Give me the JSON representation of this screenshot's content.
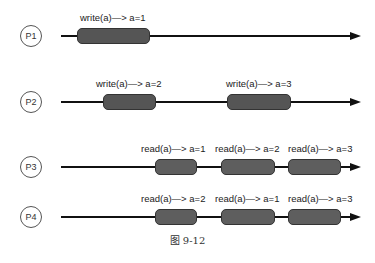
{
  "processes": [
    {
      "name": "P1",
      "ops": [
        {
          "label": "write(a)—> a=1"
        }
      ]
    },
    {
      "name": "P2",
      "ops": [
        {
          "label": "write(a)—> a=2"
        },
        {
          "label": "write(a)—> a=3"
        }
      ]
    },
    {
      "name": "P3",
      "ops": [
        {
          "label": "read(a)—> a=1"
        },
        {
          "label": "read(a)—> a=2"
        },
        {
          "label": "read(a)—> a=3"
        }
      ]
    },
    {
      "name": "P4",
      "ops": [
        {
          "label": "read(a)—> a=2"
        },
        {
          "label": "read(a)—> a=1"
        },
        {
          "label": "read(a)—> a=3"
        }
      ]
    }
  ],
  "caption": "图 9-12"
}
